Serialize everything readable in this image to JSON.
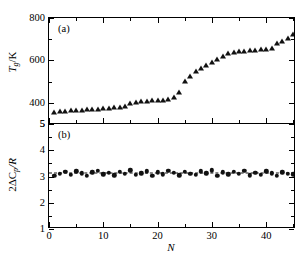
{
  "figure": {
    "xlabel": "N",
    "panel_a_tag": "(a)",
    "panel_b_tag": "(b)",
    "panel_a_ylabel_main": "T",
    "panel_a_ylabel_sub": "g",
    "panel_a_ylabel_tail": "/K",
    "panel_b_ylabel_pre": "2ΔC",
    "panel_b_ylabel_sub": "p",
    "panel_b_ylabel_tail": "/R",
    "marker_color": "#111111",
    "axis_color": "#000000"
  },
  "chart_data": [
    {
      "type": "scatter",
      "panel": "(a)",
      "title": "",
      "xlabel": "N",
      "ylabel": "T_g/K",
      "xlim": [
        0,
        45.5
      ],
      "ylim": [
        300,
        800
      ],
      "xticks": [
        0,
        10,
        20,
        30,
        40
      ],
      "yticks": [
        400,
        600,
        800
      ],
      "ytick_labels": [
        "400",
        "600",
        "800"
      ],
      "ybottom_label": "5",
      "grid": false,
      "legend": "none",
      "marker": "filled-triangle",
      "x": [
        1,
        2,
        3,
        4,
        5,
        6,
        7,
        8,
        9,
        10,
        11,
        12,
        13,
        14,
        15,
        16,
        17,
        18,
        19,
        20,
        21,
        22,
        23,
        24,
        25,
        26,
        27,
        28,
        29,
        30,
        31,
        32,
        33,
        34,
        35,
        36,
        37,
        38,
        39,
        40,
        41,
        42,
        43,
        44,
        45
      ],
      "y": [
        352,
        355,
        357,
        359,
        361,
        363,
        364,
        366,
        368,
        370,
        372,
        374,
        377,
        380,
        396,
        399,
        402,
        405,
        407,
        409,
        410,
        412,
        424,
        448,
        500,
        522,
        545,
        558,
        572,
        588,
        604,
        616,
        628,
        634,
        638,
        641,
        643,
        645,
        647,
        650,
        652,
        678,
        687,
        700,
        722
      ]
    },
    {
      "type": "scatter",
      "panel": "(b)",
      "title": "",
      "xlabel": "N",
      "ylabel": "2ΔC_p/R",
      "xlim": [
        0,
        45.5
      ],
      "ylim": [
        1,
        5
      ],
      "xticks": [
        0,
        10,
        20,
        30,
        40
      ],
      "yticks": [
        1,
        2,
        3,
        4,
        5
      ],
      "ytick_labels": [
        "1",
        "2",
        "3",
        "4",
        "5"
      ],
      "grid": false,
      "legend": "none",
      "marker": "filled-circle",
      "reference_line": {
        "style": "dashed",
        "value": 3.15
      },
      "x": [
        1,
        2,
        3,
        4,
        5,
        6,
        7,
        8,
        9,
        10,
        11,
        12,
        13,
        14,
        15,
        16,
        17,
        18,
        19,
        20,
        21,
        22,
        23,
        24,
        25,
        26,
        27,
        28,
        29,
        30,
        31,
        32,
        33,
        34,
        35,
        36,
        37,
        38,
        39,
        40,
        41,
        42,
        43,
        44,
        45
      ],
      "y": [
        3.02,
        3.1,
        3.18,
        3.06,
        3.2,
        3.12,
        3.02,
        3.16,
        3.22,
        3.08,
        3.14,
        3.04,
        3.18,
        3.1,
        3.24,
        3.06,
        3.12,
        3.2,
        3.02,
        3.16,
        3.08,
        3.22,
        3.14,
        3.04,
        3.18,
        3.1,
        3.06,
        3.2,
        3.12,
        3.24,
        3.02,
        3.16,
        3.08,
        3.18,
        3.1,
        3.22,
        3.04,
        3.14,
        3.06,
        3.2,
        3.12,
        3.02,
        3.16,
        3.1,
        3.08
      ]
    }
  ]
}
